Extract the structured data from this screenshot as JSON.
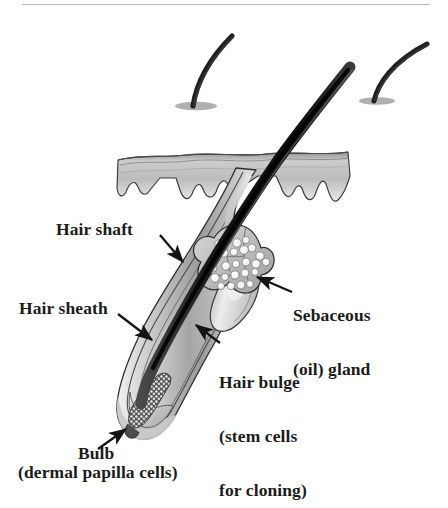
{
  "figure": {
    "background_color": "#ffffff",
    "text_color": "#1b1b1b",
    "top_rule": {
      "present": true,
      "color": "#b9b9b9"
    }
  },
  "labels": {
    "hair_shaft": "Hair shaft",
    "hair_sheath": "Hair sheath",
    "sebaceous_line1": "Sebaceous",
    "sebaceous_line2": "(oil) gland",
    "hair_bulge_line1": "Hair bulge",
    "hair_bulge_line2": "(stem cells",
    "hair_bulge_line3": "for cloning)",
    "bulb": "Bulb",
    "bulb_sub": "(dermal papilla cells)"
  },
  "structures": [
    {
      "name": "hair-shaft",
      "description": "dark emerging hair shaft"
    },
    {
      "name": "hair-sheath",
      "description": "concentric follicle sheath layers"
    },
    {
      "name": "sebaceous-gland",
      "description": "lobulated oil gland cluster"
    },
    {
      "name": "hair-bulge",
      "description": "stem cell bulge on follicle wall"
    },
    {
      "name": "hair-bulb",
      "description": "bulb with dermal papilla cells"
    },
    {
      "name": "epidermis",
      "description": "skin surface layer with rete ridges"
    },
    {
      "name": "background-hair-left",
      "description": "curved hair at skin surface"
    },
    {
      "name": "background-hair-right",
      "description": "curved hair at skin surface"
    }
  ],
  "colors": {
    "hair_dark": "#1d1d1d",
    "sheath_mid": "#8d8d8d",
    "sheath_light": "#d4d4d4",
    "skin_fill": "#b3b3b3",
    "outline": "#2b2b2b",
    "arrow": "#141414"
  }
}
